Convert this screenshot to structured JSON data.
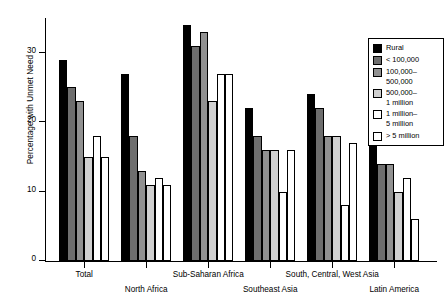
{
  "chart_data": {
    "type": "bar",
    "title": "",
    "xlabel": "",
    "ylabel": "Percentage with Unmet Need",
    "ylim": [
      0,
      35
    ],
    "yticks": [
      0,
      10,
      20,
      30
    ],
    "ytick_labels": [
      "0",
      "10",
      "20",
      "30"
    ],
    "grid": false,
    "legend_position": "upper right",
    "categories": [
      "Total",
      "North Africa",
      "Sub-Saharan Africa",
      "Southeast Asia",
      "South, Central, West Asia",
      "Latin America"
    ],
    "series": [
      {
        "name": "Rural",
        "color": "#000000",
        "values": [
          29,
          27,
          34,
          22,
          24,
          25
        ]
      },
      {
        "name": "< 100,000",
        "color": "#6e6e6e",
        "values": [
          25,
          18,
          31,
          18,
          22,
          14
        ]
      },
      {
        "name": "100,000–500,000",
        "color": "#919191",
        "values": [
          23,
          13,
          33,
          16,
          18,
          14
        ]
      },
      {
        "name": "500,000–1 million",
        "color": "#d0d0d0",
        "values": [
          15,
          11,
          23,
          16,
          18,
          10
        ]
      },
      {
        "name": "1 million–5 million",
        "color": "#ffffff",
        "values": [
          18,
          12,
          27,
          10,
          8,
          12
        ]
      },
      {
        "name": "> 5 million",
        "color": "#ffffff",
        "values": [
          15,
          11,
          27,
          16,
          17,
          6
        ]
      }
    ]
  },
  "axes": {
    "ylabel": "Percentage with Unmet Need",
    "ytick_labels": [
      "0",
      "10",
      "20",
      "30"
    ],
    "xtick_labels": [
      "Total",
      "North Africa",
      "Sub-Saharan Africa",
      "Southeast Asia",
      "South, Central, West Asia",
      "Latin America"
    ]
  },
  "legend": {
    "entries": [
      {
        "label": "Rural",
        "swatch": "#000000",
        "bordered": false
      },
      {
        "label": "< 100,000",
        "swatch": "#6e6e6e",
        "bordered": false
      },
      {
        "label": "100,000–\n500,000",
        "swatch": "#919191",
        "bordered": false
      },
      {
        "label": "500,000–\n1 million",
        "swatch": "#d0d0d0",
        "bordered": false
      },
      {
        "label": "1 million–\n5 million",
        "swatch": "#ffffff",
        "bordered": true
      },
      {
        "label": "> 5 million",
        "swatch": "#ffffff",
        "bordered": true
      }
    ]
  }
}
